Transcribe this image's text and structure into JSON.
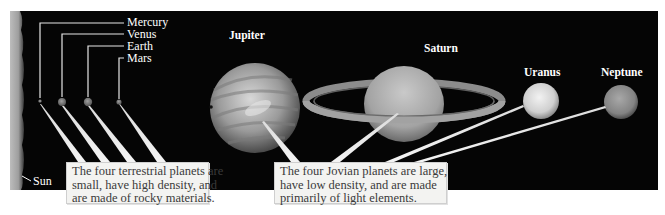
{
  "figure": {
    "background_color": "#050505",
    "label_color": "#ffffff",
    "caption_background": "#f3f3f1"
  },
  "terrestrial_labels": [
    {
      "name": "Mercury"
    },
    {
      "name": "Venus"
    },
    {
      "name": "Earth"
    },
    {
      "name": "Mars"
    }
  ],
  "sun": {
    "label": "Sun"
  },
  "jovian_labels": [
    {
      "name": "Jupiter"
    },
    {
      "name": "Saturn"
    },
    {
      "name": "Uranus"
    },
    {
      "name": "Neptune"
    }
  ],
  "captions": {
    "terrestrial": {
      "lines": [
        "The four terrestrial planets are",
        "small, have high density, and",
        "are made of rocky materials."
      ]
    },
    "jovian": {
      "lines": [
        "The four Jovian planets are large,",
        "have low density, and are made",
        "primarily of light elements."
      ]
    }
  }
}
